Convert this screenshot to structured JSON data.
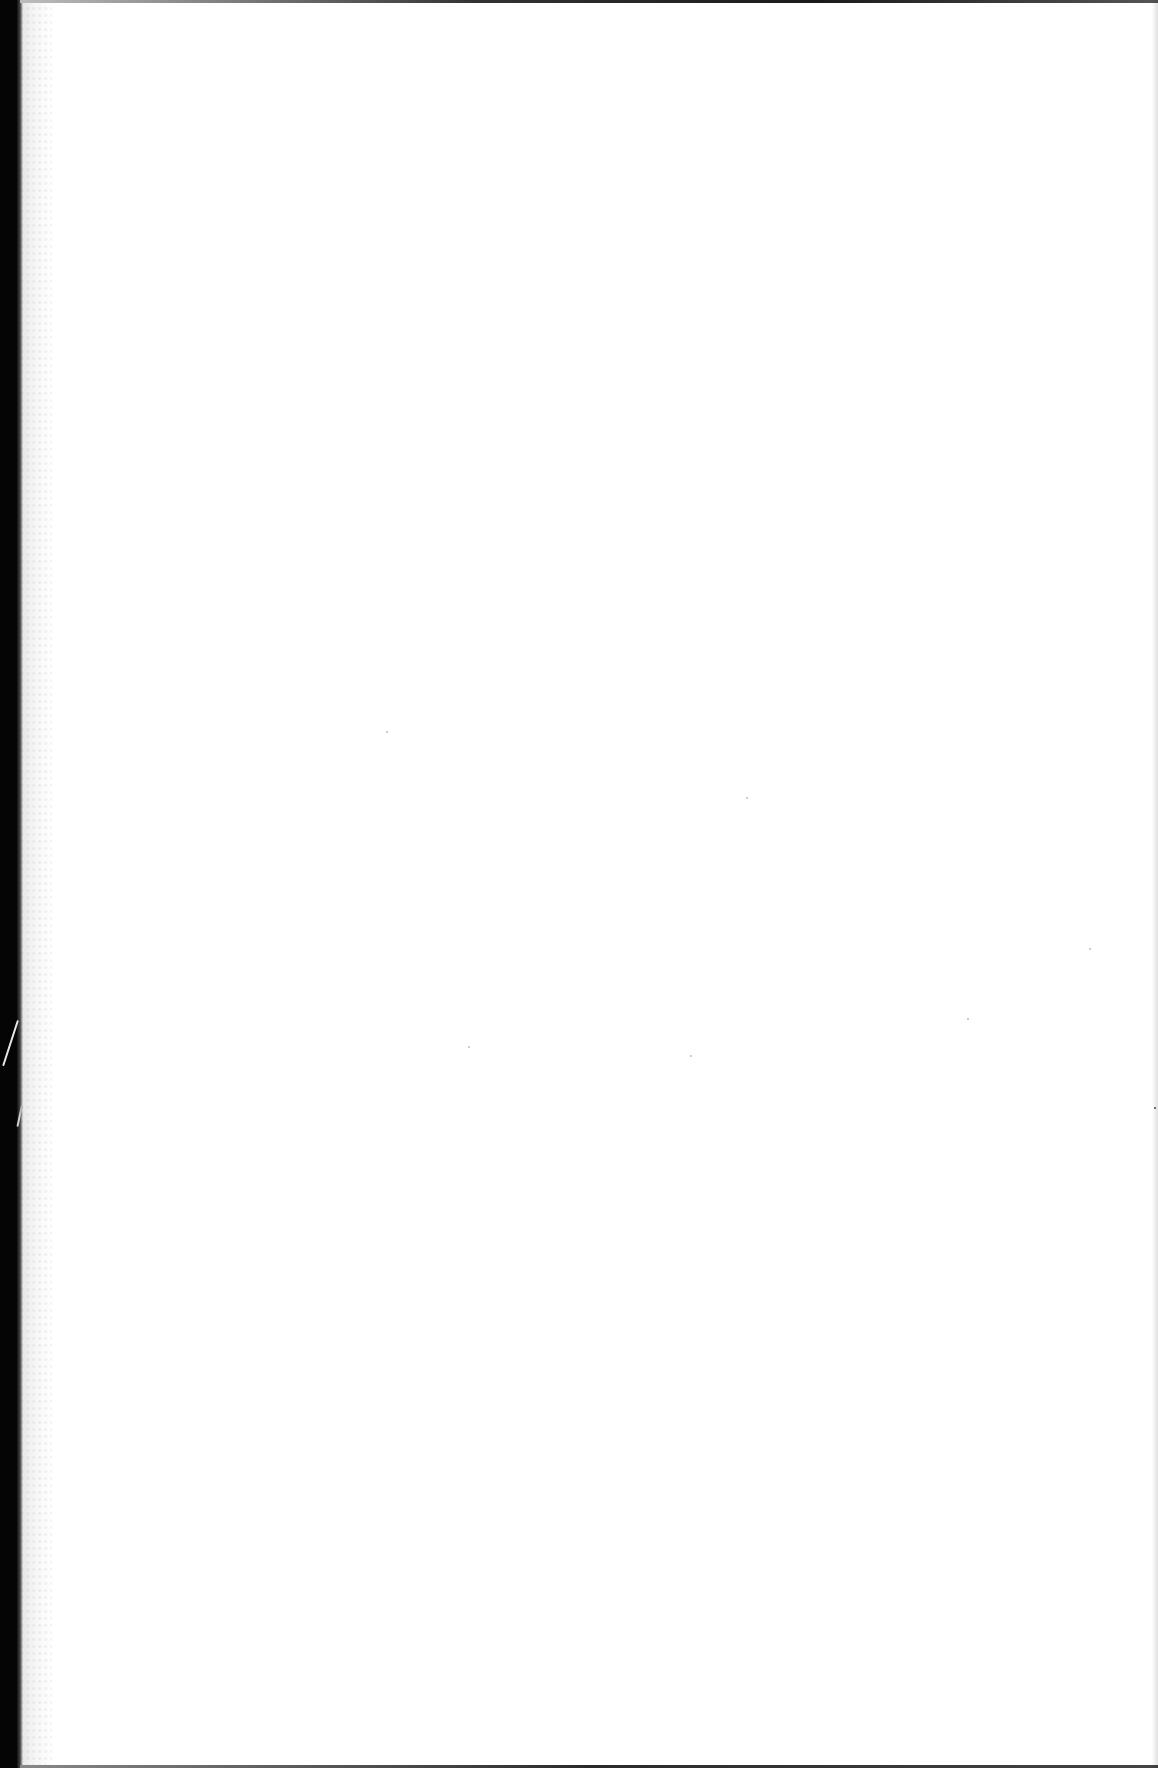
{
  "document": {
    "type": "scanned page",
    "content": "",
    "is_blank": true
  },
  "colors": {
    "paper": "#ffffff",
    "binding": "#050505",
    "edge": "#1a1a1a"
  }
}
